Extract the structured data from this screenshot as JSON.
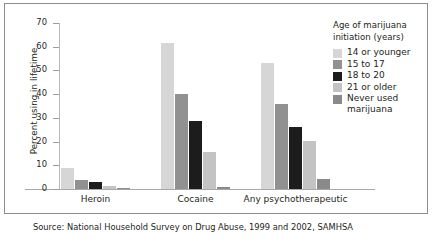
{
  "chart_data": {
    "type": "bar",
    "title": "",
    "xlabel": "",
    "ylabel": "Percent using in lifetime",
    "ylim": [
      0,
      70
    ],
    "yticks": [
      0,
      10,
      20,
      30,
      40,
      50,
      60,
      70
    ],
    "grid": false,
    "legend_position": "right",
    "legend_title": "Age of marijuana initiation (years)",
    "categories": [
      "Heroin",
      "Cocaine",
      "Any psychotherapeutic"
    ],
    "series": [
      {
        "name": "14 or younger",
        "color": "#d6d6d6",
        "values": [
          8.8,
          61.5,
          53.0
        ]
      },
      {
        "name": "15 to 17",
        "color": "#919191",
        "values": [
          4.0,
          40.2,
          35.8
        ]
      },
      {
        "name": "18 to 20",
        "color": "#1c1c1c",
        "values": [
          2.8,
          28.5,
          26.0
        ]
      },
      {
        "name": "21 or older",
        "color": "#c3c3c3",
        "values": [
          1.2,
          15.6,
          20.2
        ]
      },
      {
        "name": "Never used marijuana",
        "color": "#8a8a8a",
        "values": [
          0.4,
          1.0,
          4.2
        ]
      }
    ],
    "source": "Source: National Household Survey on Drug Abuse, 1999 and 2002, SAMHSA"
  },
  "legend": {
    "title_line1": "Age of marijuana",
    "title_line2": "initiation (years)",
    "items": [
      {
        "label": "14 or younger",
        "color": "#d6d6d6"
      },
      {
        "label": "15 to 17",
        "color": "#919191"
      },
      {
        "label": "18 to 20",
        "color": "#1c1c1c"
      },
      {
        "label": "21 or older",
        "color": "#c3c3c3"
      },
      {
        "label": "Never used\nmarijuana",
        "color": "#8a8a8a"
      }
    ]
  },
  "axis": {
    "y_title": "Percent using in lifetime",
    "y_tick_labels": [
      "70",
      "60",
      "50",
      "40",
      "30",
      "20",
      "10",
      "0"
    ]
  },
  "groups": [
    {
      "label": "Heroin"
    },
    {
      "label": "Cocaine"
    },
    {
      "label": "Any psychotherapeutic"
    }
  ],
  "footer": {
    "source": "Source: National Household Survey on Drug Abuse, 1999 and 2002, SAMHSA"
  }
}
